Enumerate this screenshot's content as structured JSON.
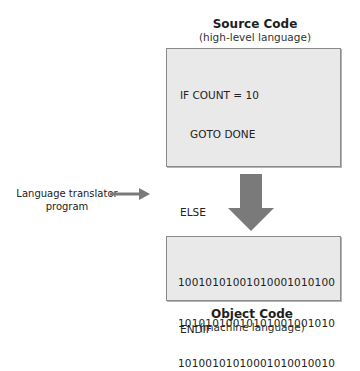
{
  "source": {
    "title": "Source Code",
    "subtitle": "(high-level language)",
    "lines": [
      "IF COUNT = 10",
      "   GOTO DONE",
      "",
      "ELSE",
      "   GOTO AGAIN",
      "",
      "ENDIF"
    ]
  },
  "translator": {
    "label_line1": "Language translator",
    "label_line2": "program",
    "arrow_icon": "right-arrow-icon"
  },
  "flow_arrow": {
    "icon": "down-arrow-icon",
    "color": "#7a7a7a"
  },
  "object": {
    "title": "Object Code",
    "subtitle": "(machine language)",
    "lines": [
      "10010101001010001010100",
      "10101010010101001001010",
      "10100101010001010010010"
    ]
  },
  "colors": {
    "box_fill": "#e9e9e9",
    "box_border": "#8a8a8a",
    "arrow": "#7a7a7a"
  }
}
